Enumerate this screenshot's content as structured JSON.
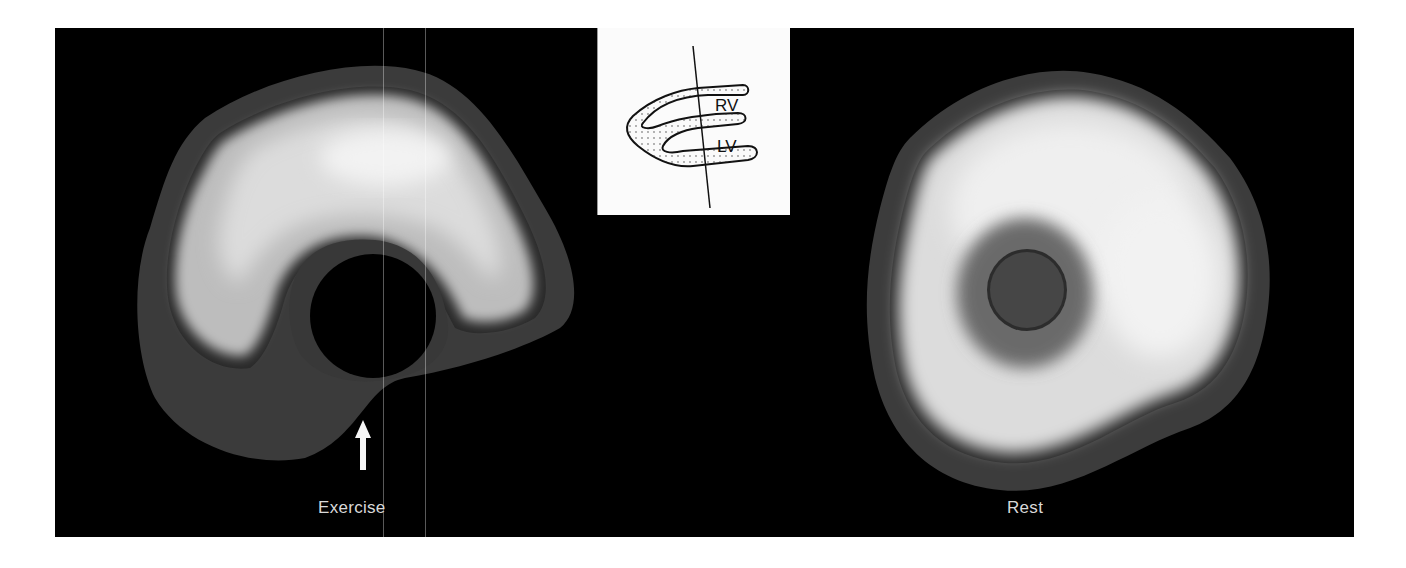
{
  "figure": {
    "panels": [
      {
        "id": "exercise",
        "label": "Exercise",
        "annotation": "arrow-up"
      },
      {
        "id": "rest",
        "label": "Rest"
      }
    ],
    "inset": {
      "labels": [
        "RV",
        "LV"
      ]
    },
    "colors": {
      "background": "#000000",
      "outer_ring": "#3c3c3c",
      "mid_ring": "#8a8a8a",
      "bright": "#ececec",
      "page": "#ffffff"
    }
  }
}
